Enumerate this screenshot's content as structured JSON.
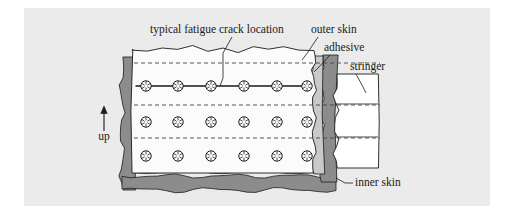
{
  "figure": {
    "background_color": "#ffffff",
    "panel_color": "#ebebeb",
    "panel": {
      "x": 24,
      "y": 8,
      "width": 466,
      "height": 198
    }
  },
  "colors": {
    "panel_background": "#ebebeb",
    "outer_skin_fill": "#fbfbfb",
    "adhesive_fill": "#c9c9c9",
    "inner_skin_fill": "#8c8c8c",
    "stringer_fill": "#ffffff",
    "line_color": "#1a1a1a",
    "dashed_line_color": "#444444",
    "rivet_fill": "#ffffff",
    "text_color": "#1a1a1a"
  },
  "labels": {
    "crack_location": {
      "text": "typical fatigue crack location",
      "x": 150,
      "y": 33,
      "anchor": "start",
      "leader": [
        [
          232,
          37
        ],
        [
          223,
          53
        ],
        [
          223,
          78
        ],
        [
          220,
          86
        ]
      ]
    },
    "outer_skin": {
      "text": "outer skin",
      "x": 311,
      "y": 33,
      "anchor": "start",
      "leader": [
        [
          318,
          37
        ],
        [
          308,
          52
        ],
        [
          302,
          60
        ]
      ]
    },
    "adhesive": {
      "text": "adhesive",
      "x": 324,
      "y": 51,
      "anchor": "start",
      "leader": [
        [
          330,
          55
        ],
        [
          319,
          67
        ],
        [
          314,
          72
        ]
      ]
    },
    "stringer": {
      "text": "stringer",
      "x": 350,
      "y": 70,
      "anchor": "start",
      "leader": [
        [
          356,
          74
        ],
        [
          363,
          87
        ],
        [
          366,
          93
        ]
      ]
    },
    "inner_skin": {
      "text": "inner skin",
      "x": 355,
      "y": 186,
      "anchor": "start",
      "leader": [
        [
          336,
          178
        ],
        [
          345,
          183
        ],
        [
          353,
          183
        ]
      ]
    },
    "up_direction": {
      "text": "up",
      "x": 104,
      "y": 140,
      "anchor": "middle",
      "arrow": {
        "x": 104,
        "y_top": 106,
        "y_bottom": 131
      }
    }
  },
  "structure": {
    "outer_skin_panel": {
      "x": 132,
      "y": 49,
      "width": 182,
      "height": 124,
      "wavy_top": true,
      "wavy_right": true,
      "description": "outer skin sheet with torn/wavy top edge"
    },
    "adhesive_layer": {
      "x": 312,
      "y": 56,
      "width": 12,
      "height": 118,
      "description": "light gray adhesive strip on right of outer skin"
    },
    "inner_skin": {
      "description": "dark gray skin wrapping left, bottom and right of the assembly",
      "left_band_x": 122,
      "left_band_width": 13,
      "bottom_band_y": 176,
      "bottom_band_height": 14,
      "right_band_x": 322,
      "right_band_width": 14
    },
    "stringer": {
      "x": 336,
      "y": 74,
      "width": 42,
      "height": 94,
      "divider_y": [
        104,
        137
      ],
      "description": "white stringer section with wavy vertical edges and two horizontal dividers"
    },
    "dashed_lines": [
      {
        "name": "dashed-line-top",
        "y": 63,
        "x1": 134,
        "x2": 380
      },
      {
        "name": "dashed-line-middle",
        "y": 105,
        "x1": 134,
        "x2": 380
      },
      {
        "name": "dashed-line-bottom",
        "y": 138,
        "x1": 134,
        "x2": 380
      }
    ],
    "crack_line": {
      "y": 86,
      "x1": 136,
      "x2": 312,
      "description": "horizontal fatigue crack line through top rivet row"
    }
  },
  "rivets": {
    "radius": 5.2,
    "spoke_count": 6,
    "columns_x": [
      146,
      178,
      211,
      244,
      277,
      307
    ],
    "rows": [
      {
        "name": "rivet-row-top",
        "y": 86,
        "has_crack": true,
        "count": 6
      },
      {
        "name": "rivet-row-middle",
        "y": 122,
        "has_crack": false,
        "count": 6
      },
      {
        "name": "rivet-row-bottom",
        "y": 156,
        "has_crack": false,
        "count": 6
      }
    ]
  }
}
